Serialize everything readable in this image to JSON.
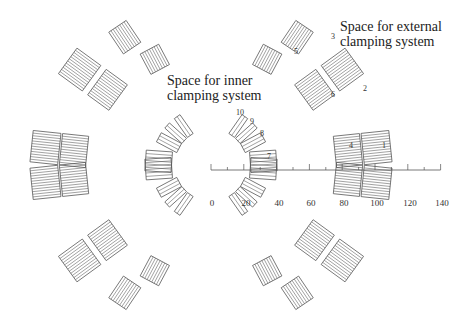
{
  "annotations": {
    "inner": {
      "line1": "Space for inner",
      "line2": "clamping system"
    },
    "external": {
      "line1": "Space for external",
      "line2": "clamping system"
    }
  },
  "axis": {
    "ticks": [
      "0",
      "20",
      "40",
      "60",
      "80",
      "100",
      "120",
      "140"
    ],
    "min": 0,
    "max": 140
  },
  "block_numbers": [
    "1",
    "2",
    "3",
    "4",
    "5",
    "6",
    "7",
    "8",
    "9",
    "10"
  ],
  "colors": {
    "line": "#555555",
    "text": "#222222",
    "background": "#ffffff"
  }
}
